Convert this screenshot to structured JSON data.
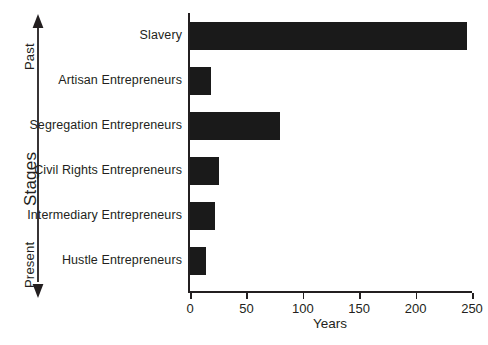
{
  "chart_data": {
    "type": "bar",
    "orientation": "horizontal",
    "title": "",
    "subtitle": "",
    "categories": [
      "Slavery",
      "Artisan Entrepreneurs",
      "Segregation Entrepreneurs",
      "Civil Rights Entrepreneurs",
      "Intermediary Entrepreneurs",
      "Hustle Entrepreneurs"
    ],
    "values": [
      246,
      19,
      80,
      26,
      22,
      14
    ],
    "xlabel": "Years",
    "ylabel": "Stages",
    "xlim": [
      0,
      250
    ],
    "xticks": [
      0,
      50,
      100,
      150,
      200,
      250
    ],
    "xtick_labels": [
      "0",
      "50",
      "100",
      "150",
      "200",
      "250"
    ],
    "grid": false,
    "legend": false,
    "bar_color": "#1a1a1a",
    "axis_color": "#231f20",
    "background_color": "#ffffff",
    "annotations": {
      "axis_top": "Past",
      "axis_bottom": "Present"
    }
  },
  "axis": {
    "y_title": "Stages",
    "y_top_label": "Past",
    "y_bottom_label": "Present",
    "x_title": "Years"
  },
  "series": [
    {
      "label": "Slavery",
      "value": 246
    },
    {
      "label": "Artisan Entrepreneurs",
      "value": 19
    },
    {
      "label": "Segregation Entrepreneurs",
      "value": 80
    },
    {
      "label": "Civil Rights Entrepreneurs",
      "value": 26
    },
    {
      "label": "Intermediary Entrepreneurs",
      "value": 22
    },
    {
      "label": "Hustle Entrepreneurs",
      "value": 14
    }
  ],
  "ticks": [
    {
      "value": 0,
      "label": "0"
    },
    {
      "value": 50,
      "label": "50"
    },
    {
      "value": 100,
      "label": "100"
    },
    {
      "value": 150,
      "label": "150"
    },
    {
      "value": 200,
      "label": "200"
    },
    {
      "value": 250,
      "label": "250"
    }
  ]
}
